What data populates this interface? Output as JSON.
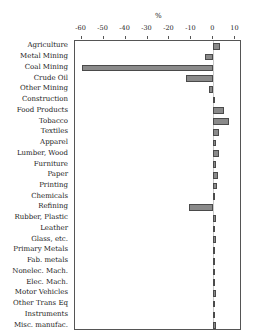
{
  "chart_data": {
    "type": "bar",
    "orientation": "horizontal",
    "title": "",
    "xlabel": "%",
    "ylabel": "",
    "xlim": [
      -63,
      13
    ],
    "ticks": [
      -60,
      -50,
      -40,
      -30,
      -20,
      -10,
      0,
      10
    ],
    "tick_labels": [
      "-60",
      "-50",
      "-40",
      "-30",
      "-20",
      "-10",
      "0",
      "10"
    ],
    "grid": false,
    "legend": null,
    "axis_position": "top",
    "bar_color": "#8a8a8a",
    "bar_edge_color": "#4a4a4a",
    "frame_color": "#555555",
    "categories": [
      "Agriculture",
      "Metal Mining",
      "Coal Mining",
      "Crude Oil",
      "Other Mining",
      "Construction",
      "Food Products",
      "Tobacco",
      "Textiles",
      "Apparel",
      "Lumber, Wood",
      "Furniture",
      "Paper",
      "Printing",
      "Chemicals",
      "Refining",
      "Rubber, Plastic",
      "Leather",
      "Glass, etc.",
      "Primary Metals",
      "Fab. metals",
      "Nonelec. Mach.",
      "Elec. Mach.",
      "Motor Vehicles",
      "Other Trans Eq",
      "Instruments",
      "Misc. manufac."
    ],
    "values": [
      3.0,
      -4.0,
      -60.0,
      -12.5,
      -2.0,
      0.3,
      5.0,
      7.0,
      2.5,
      1.0,
      2.5,
      1.2,
      2.0,
      1.5,
      0.5,
      -11.0,
      1.2,
      0.6,
      1.0,
      0.8,
      0.5,
      0.5,
      0.5,
      1.0,
      0.8,
      0.4,
      1.2
    ]
  }
}
